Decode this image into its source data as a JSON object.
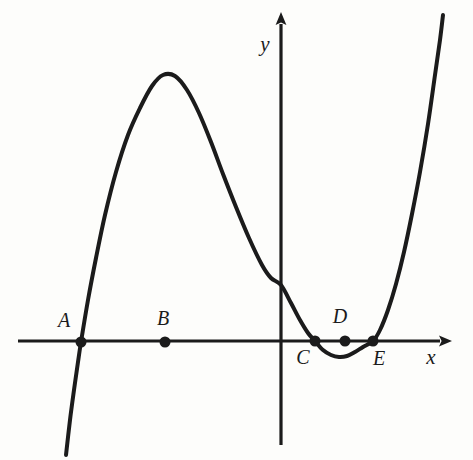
{
  "figure": {
    "kind": "cartesian-plot",
    "background_color": "#fdfdfb",
    "ink_color": "#1b1b1b",
    "width": 473,
    "height": 460
  },
  "axes": {
    "x_label": "x",
    "y_label": "y",
    "x_axis": {
      "y_pixel": 341,
      "x_start": 18,
      "x_end": 452,
      "arrow": "right"
    },
    "y_axis": {
      "x_pixel": 281,
      "y_start": 12,
      "y_end": 445,
      "arrow": "up"
    },
    "origin": {
      "x": 281,
      "y": 341
    },
    "tick_labels": [],
    "grid": "off"
  },
  "chart_data": {
    "type": "line",
    "title": "",
    "xlabel": "x",
    "ylabel": "y",
    "grid": false,
    "legend": "none",
    "axis_style": "arrows-both-ends",
    "xlim": [
      18,
      452
    ],
    "ylim": [
      12,
      445
    ],
    "curve": {
      "name": "quartic-curve",
      "description": "Quartic-like polynomial: rises steeply from lower-left, local maximum left of the y-axis, falls across the y-axis, touches a shallow local minimum just right of the y-axis between C and E, then rises steeply.",
      "stroke_width": 4,
      "points_pixel": [
        [
          66,
          455
        ],
        [
          70,
          420
        ],
        [
          74,
          390
        ],
        [
          78,
          362
        ],
        [
          81,
          342
        ],
        [
          88,
          300
        ],
        [
          96,
          258
        ],
        [
          105,
          215
        ],
        [
          116,
          172
        ],
        [
          128,
          135
        ],
        [
          140,
          108
        ],
        [
          152,
          86
        ],
        [
          163,
          75
        ],
        [
          175,
          76
        ],
        [
          187,
          90
        ],
        [
          199,
          113
        ],
        [
          211,
          142
        ],
        [
          223,
          174
        ],
        [
          236,
          207
        ],
        [
          249,
          238
        ],
        [
          262,
          265
        ],
        [
          271,
          278
        ],
        [
          281,
          285
        ],
        [
          291,
          303
        ],
        [
          300,
          320
        ],
        [
          308,
          333
        ],
        [
          315,
          341
        ],
        [
          323,
          350
        ],
        [
          331,
          355
        ],
        [
          339,
          357
        ],
        [
          347,
          356
        ],
        [
          355,
          352
        ],
        [
          363,
          347
        ],
        [
          373,
          341
        ],
        [
          380,
          330
        ],
        [
          388,
          310
        ],
        [
          396,
          284
        ],
        [
          404,
          252
        ],
        [
          412,
          214
        ],
        [
          420,
          172
        ],
        [
          428,
          124
        ],
        [
          435,
          75
        ],
        [
          440,
          40
        ],
        [
          443,
          15
        ]
      ],
      "local_maximum_pixel": [
        163,
        75
      ],
      "local_minimum_pixel": [
        345,
        356
      ],
      "y_intercept_pixel": [
        281,
        285
      ]
    },
    "marked_points": [
      {
        "label": "A",
        "x": 81,
        "y": 342,
        "label_x": 64,
        "label_y": 322,
        "label_position": "above-left",
        "on_curve": true,
        "role": "x-intercept"
      },
      {
        "label": "B",
        "x": 165,
        "y": 342,
        "label_x": 163,
        "label_y": 320,
        "label_position": "above",
        "on_curve": false,
        "role": "axis-point"
      },
      {
        "label": "C",
        "x": 315,
        "y": 341,
        "label_x": 303,
        "label_y": 359,
        "label_position": "below-left",
        "on_curve": true,
        "role": "x-intercept"
      },
      {
        "label": "D",
        "x": 345,
        "y": 341,
        "label_x": 340,
        "label_y": 318,
        "label_position": "above",
        "on_curve": false,
        "role": "axis-point"
      },
      {
        "label": "E",
        "x": 373,
        "y": 341,
        "label_x": 379,
        "label_y": 360,
        "label_position": "below-right",
        "on_curve": true,
        "role": "x-intercept"
      }
    ],
    "marker_radius": 5.5
  }
}
